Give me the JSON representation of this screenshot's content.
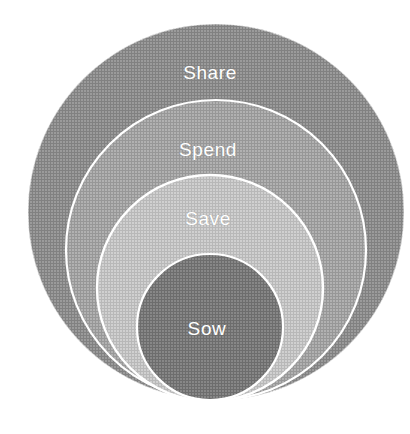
{
  "diagram": {
    "type": "nested-concentric-circles",
    "background_color": "#ffffff",
    "texture": "halftone-dot-screen",
    "stroke_color": "#ffffff",
    "label_color": "#ffffff",
    "rings": [
      {
        "id": "share",
        "label": "Share",
        "order": 1,
        "level": "outermost",
        "fill_color": "#9e9e9e",
        "center_x": 216,
        "center_y": 212,
        "radius": 188,
        "label_x": 210,
        "label_y": 73
      },
      {
        "id": "spend",
        "label": "Spend",
        "order": 2,
        "level": "second",
        "fill_color": "#b4b4b4",
        "center_x": 216,
        "center_y": 250,
        "radius": 150,
        "label_x": 208,
        "label_y": 150
      },
      {
        "id": "save",
        "label": "Save",
        "order": 3,
        "level": "third",
        "fill_color": "#d2d2d2",
        "center_x": 210,
        "center_y": 288,
        "radius": 113,
        "label_x": 208,
        "label_y": 219
      },
      {
        "id": "sow",
        "label": "Sow",
        "order": 4,
        "level": "innermost",
        "fill_color": "#8a8a8a",
        "center_x": 210,
        "center_y": 327,
        "radius": 73,
        "label_x": 207,
        "label_y": 329
      }
    ]
  }
}
